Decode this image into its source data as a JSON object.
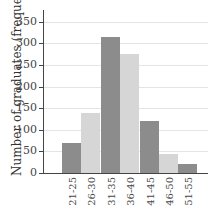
{
  "chart_data": {
    "type": "bar",
    "title": "",
    "xlabel": "",
    "ylabel": "Number of graduates (frequency)",
    "categories": [
      "21-25",
      "26-30",
      "31-35",
      "36-40",
      "41-45",
      "46-50",
      "51-55"
    ],
    "values": [
      70,
      140,
      315,
      275,
      120,
      45,
      20
    ],
    "ylim": [
      0,
      375
    ],
    "yticks": [
      0,
      50,
      100,
      150,
      200,
      250,
      300,
      350
    ],
    "grid": true,
    "legend": null,
    "bar_colors": [
      "#8c8c8c",
      "#d6d6d6",
      "#8c8c8c",
      "#d6d6d6",
      "#8c8c8c",
      "#d6d6d6",
      "#8c8c8c"
    ]
  },
  "axis": {
    "ylabel": "Number of graduates (frequency)",
    "yticks": [
      "0",
      "50",
      "100",
      "150",
      "200",
      "250",
      "300",
      "350"
    ],
    "xticks": [
      "21-25",
      "26-30",
      "31-35",
      "36-40",
      "41-45",
      "46-50",
      "51-55"
    ]
  }
}
